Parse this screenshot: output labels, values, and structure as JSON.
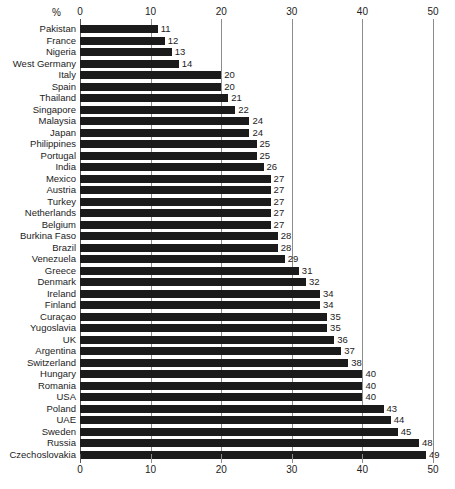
{
  "chart_data": {
    "type": "bar",
    "orientation": "horizontal",
    "title": "",
    "subtitle": "",
    "xlabel": "%",
    "ylabel": "",
    "xlim": [
      0,
      50
    ],
    "xticks": [
      0,
      10,
      20,
      30,
      40,
      50
    ],
    "xtick_labels": [
      "0",
      "10",
      "20",
      "30",
      "40",
      "50"
    ],
    "grid": true,
    "grid_axis": "x",
    "legend": false,
    "legend_position": "none",
    "axis_top": true,
    "axis_bottom": true,
    "value_labels": true,
    "bar_color": "#1b1b1b",
    "grid_color": "#8c8c8c",
    "background_color": "#ffffff",
    "categories": [
      "Pakistan",
      "France",
      "Nigeria",
      "West Germany",
      "Italy",
      "Spain",
      "Thailand",
      "Singapore",
      "Malaysia",
      "Japan",
      "Philippines",
      "Portugal",
      "India",
      "Mexico",
      "Austria",
      "Turkey",
      "Netherlands",
      "Belgium",
      "Burkina Faso",
      "Brazil",
      "Venezuela",
      "Greece",
      "Denmark",
      "Ireland",
      "Finland",
      "Curaçao",
      "Yugoslavia",
      "UK",
      "Argentina",
      "Switzerland",
      "Hungary",
      "Romania",
      "USA",
      "Poland",
      "UAE",
      "Sweden",
      "Russia",
      "Czechoslovakia"
    ],
    "values": [
      11,
      12,
      13,
      14,
      20,
      20,
      21,
      22,
      24,
      24,
      25,
      25,
      26,
      27,
      27,
      27,
      27,
      27,
      28,
      28,
      29,
      31,
      32,
      34,
      34,
      35,
      35,
      36,
      37,
      38,
      40,
      40,
      40,
      43,
      44,
      45,
      48,
      49
    ]
  }
}
